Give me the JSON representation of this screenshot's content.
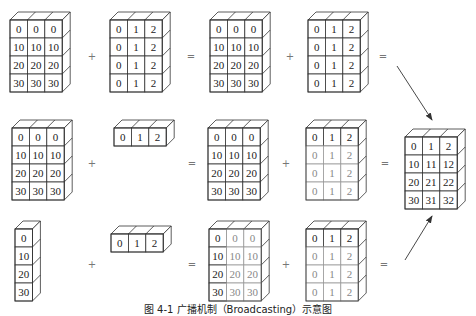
{
  "figure": {
    "caption": "图 4-1  广播机制（Broadcasting）示意图",
    "cell_w": 17.4,
    "cell_h": 18,
    "depth_dx": 8,
    "depth_dy": 8,
    "stroke_color": "#333333",
    "faded_text_color": "#888888",
    "faded_stroke_color": "#999999",
    "rows": [
      {
        "name": "row-1",
        "blocks": [
          {
            "name": "a-matrix",
            "x": 10,
            "y": 20,
            "cells": [
              [
                "0",
                "0",
                "0"
              ],
              [
                "10",
                "10",
                "10"
              ],
              [
                "20",
                "20",
                "20"
              ],
              [
                "30",
                "30",
                "30"
              ]
            ]
          },
          {
            "name": "b-matrix",
            "x": 110,
            "y": 20,
            "cells": [
              [
                "0",
                "1",
                "2"
              ],
              [
                "0",
                "1",
                "2"
              ],
              [
                "0",
                "1",
                "2"
              ],
              [
                "0",
                "1",
                "2"
              ]
            ]
          },
          {
            "name": "a-result",
            "x": 210,
            "y": 20,
            "cells": [
              [
                "0",
                "0",
                "0"
              ],
              [
                "10",
                "10",
                "10"
              ],
              [
                "20",
                "20",
                "20"
              ],
              [
                "30",
                "30",
                "30"
              ]
            ]
          },
          {
            "name": "b-result",
            "x": 308,
            "y": 20,
            "cells": [
              [
                "0",
                "1",
                "2"
              ],
              [
                "0",
                "1",
                "2"
              ],
              [
                "0",
                "1",
                "2"
              ],
              [
                "0",
                "1",
                "2"
              ]
            ]
          }
        ],
        "operators": [
          {
            "symbol": "+",
            "x": 92,
            "y": 60
          },
          {
            "symbol": "=",
            "x": 191,
            "y": 60
          },
          {
            "symbol": "+",
            "x": 290,
            "y": 60
          },
          {
            "symbol": "=",
            "x": 383,
            "y": 60
          }
        ]
      },
      {
        "name": "row-2",
        "blocks": [
          {
            "name": "a-matrix",
            "x": 12,
            "y": 128,
            "cells": [
              [
                "0",
                "0",
                "0"
              ],
              [
                "10",
                "10",
                "10"
              ],
              [
                "20",
                "20",
                "20"
              ],
              [
                "30",
                "30",
                "30"
              ]
            ]
          },
          {
            "name": "b-vector",
            "x": 114,
            "y": 128,
            "cells": [
              [
                "0",
                "1",
                "2"
              ]
            ]
          },
          {
            "name": "a-result",
            "x": 208,
            "y": 128,
            "cells": [
              [
                "0",
                "0",
                "0"
              ],
              [
                "10",
                "10",
                "10"
              ],
              [
                "20",
                "20",
                "20"
              ],
              [
                "30",
                "30",
                "30"
              ]
            ]
          },
          {
            "name": "b-broadcast",
            "x": 306,
            "y": 128,
            "cells": [
              [
                "0",
                "1",
                "2"
              ],
              [
                "0",
                "1",
                "2"
              ],
              [
                "0",
                "1",
                "2"
              ],
              [
                "0",
                "1",
                "2"
              ]
            ],
            "faded_rows": [
              1,
              2,
              3
            ]
          }
        ],
        "operators": [
          {
            "symbol": "+",
            "x": 92,
            "y": 167
          },
          {
            "symbol": "=",
            "x": 192,
            "y": 167
          },
          {
            "symbol": "+",
            "x": 286,
            "y": 167
          },
          {
            "symbol": "=",
            "x": 385,
            "y": 167
          }
        ]
      },
      {
        "name": "row-3",
        "blocks": [
          {
            "name": "a-column",
            "x": 15,
            "y": 229,
            "cells": [
              [
                "0"
              ],
              [
                "10"
              ],
              [
                "20"
              ],
              [
                "30"
              ]
            ]
          },
          {
            "name": "b-vector",
            "x": 111,
            "y": 234,
            "cells": [
              [
                "0",
                "1",
                "2"
              ]
            ]
          },
          {
            "name": "a-broadcast",
            "x": 209,
            "y": 229,
            "cells": [
              [
                "0",
                "0",
                "0"
              ],
              [
                "10",
                "10",
                "10"
              ],
              [
                "20",
                "20",
                "20"
              ],
              [
                "30",
                "30",
                "30"
              ]
            ],
            "faded_cols": [
              1,
              2
            ]
          },
          {
            "name": "b-broadcast",
            "x": 306,
            "y": 229,
            "cells": [
              [
                "0",
                "1",
                "2"
              ],
              [
                "0",
                "1",
                "2"
              ],
              [
                "0",
                "1",
                "2"
              ],
              [
                "0",
                "1",
                "2"
              ]
            ],
            "faded_rows": [
              1,
              2,
              3
            ]
          }
        ],
        "operators": [
          {
            "symbol": "+",
            "x": 92,
            "y": 268
          },
          {
            "symbol": "=",
            "x": 192,
            "y": 268
          },
          {
            "symbol": "+",
            "x": 286,
            "y": 268
          },
          {
            "symbol": "=",
            "x": 384,
            "y": 268
          }
        ]
      }
    ],
    "result": {
      "name": "final-result",
      "x": 405,
      "y": 137,
      "cells": [
        [
          "0",
          "1",
          "2"
        ],
        [
          "10",
          "11",
          "12"
        ],
        [
          "20",
          "21",
          "22"
        ],
        [
          "30",
          "31",
          "32"
        ]
      ]
    },
    "arrows": [
      {
        "name": "arrow-from-row-1",
        "x1": 397,
        "y1": 66,
        "x2": 432,
        "y2": 120
      },
      {
        "name": "arrow-from-row-3",
        "x1": 405,
        "y1": 260,
        "x2": 432,
        "y2": 216
      }
    ]
  }
}
